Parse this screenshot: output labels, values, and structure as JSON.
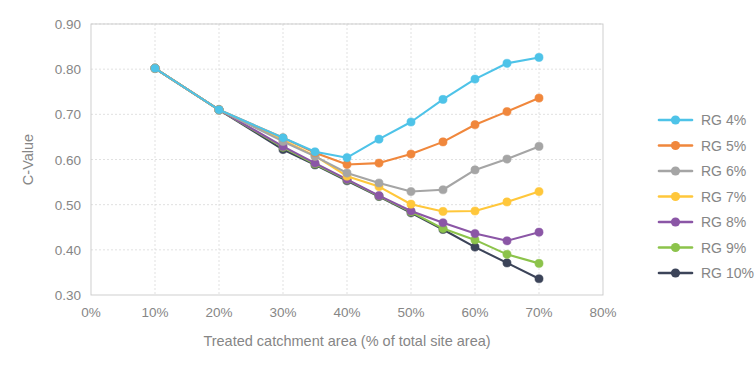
{
  "chart_data": {
    "type": "line",
    "title": "",
    "xlabel": "Treated catchment area (% of total site area)",
    "ylabel": "C-Value",
    "xlim": [
      0,
      80
    ],
    "ylim": [
      0.3,
      0.9
    ],
    "x": [
      10,
      20,
      30,
      35,
      40,
      45,
      50,
      55,
      60,
      65,
      70
    ],
    "xticks": [
      "0%",
      "10%",
      "20%",
      "30%",
      "40%",
      "50%",
      "60%",
      "70%",
      "80%"
    ],
    "xtick_values": [
      0,
      10,
      20,
      30,
      40,
      50,
      60,
      70,
      80
    ],
    "yticks": [
      "0.30",
      "0.40",
      "0.50",
      "0.60",
      "0.70",
      "0.80",
      "0.90"
    ],
    "ytick_values": [
      0.3,
      0.4,
      0.5,
      0.6,
      0.7,
      0.8,
      0.9
    ],
    "grid": true,
    "legend_position": "right",
    "marker": "circle",
    "series": [
      {
        "name": "RG 4%",
        "color": "#4EC3E8",
        "values": [
          0.802,
          0.71,
          0.648,
          0.617,
          0.604,
          0.645,
          0.683,
          0.733,
          0.778,
          0.813,
          0.826
        ]
      },
      {
        "name": "RG 5%",
        "color": "#F0873C",
        "values": [
          0.802,
          0.71,
          0.648,
          0.615,
          0.589,
          0.592,
          0.612,
          0.639,
          0.677,
          0.706,
          0.736
        ]
      },
      {
        "name": "RG 6%",
        "color": "#A5A5A5",
        "values": [
          0.802,
          0.71,
          0.64,
          0.607,
          0.57,
          0.548,
          0.529,
          0.533,
          0.577,
          0.601,
          0.629
        ]
      },
      {
        "name": "RG 7%",
        "color": "#FFC73B",
        "values": [
          0.802,
          0.71,
          0.643,
          0.608,
          0.563,
          0.54,
          0.501,
          0.485,
          0.486,
          0.506,
          0.529
        ]
      },
      {
        "name": "RG 8%",
        "color": "#8B56A6",
        "values": [
          0.802,
          0.71,
          0.629,
          0.592,
          0.556,
          0.52,
          0.486,
          0.46,
          0.436,
          0.42,
          0.439
        ]
      },
      {
        "name": "RG 9%",
        "color": "#8CC34B",
        "values": [
          0.802,
          0.71,
          0.627,
          0.59,
          0.555,
          0.519,
          0.484,
          0.447,
          0.422,
          0.39,
          0.37
        ]
      },
      {
        "name": "RG 10%",
        "color": "#3C4459",
        "values": [
          0.802,
          0.71,
          0.622,
          0.588,
          0.553,
          0.518,
          0.482,
          0.445,
          0.406,
          0.371,
          0.336
        ]
      }
    ]
  }
}
